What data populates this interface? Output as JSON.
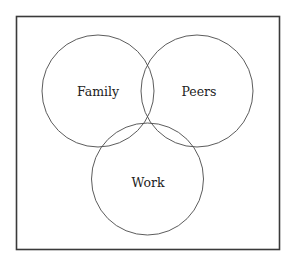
{
  "diagram": {
    "type": "venn",
    "sets": [
      {
        "id": "family",
        "label": "Family"
      },
      {
        "id": "peers",
        "label": "Peers"
      },
      {
        "id": "work",
        "label": "Work"
      }
    ],
    "colors": {
      "stroke": "#4a4a4a",
      "text": "#222222",
      "background": "#ffffff"
    }
  }
}
